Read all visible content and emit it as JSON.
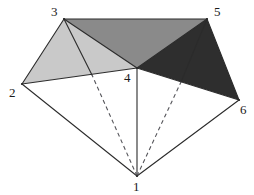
{
  "figure": {
    "canvas": {
      "width": 254,
      "height": 195,
      "background": "#ffffff"
    },
    "colors": {
      "stroke": "#2b2b2b",
      "dashed_stroke": "#55555a",
      "face_light_gray": "#c9c9c9",
      "face_medium_gray": "#8a8a8a",
      "face_dark": "#2e2e2e",
      "face_white": "#ffffff",
      "label": "#1a1a1a"
    },
    "vertices": [
      {
        "id": "1",
        "label": "1",
        "x": 137,
        "y": 176,
        "label_x": 133,
        "label_y": 180
      },
      {
        "id": "2",
        "label": "2",
        "x": 22,
        "y": 84,
        "label_x": 9,
        "label_y": 86
      },
      {
        "id": "3",
        "label": "3",
        "x": 64,
        "y": 19,
        "label_x": 51,
        "label_y": 5
      },
      {
        "id": "4",
        "label": "4",
        "x": 137,
        "y": 68,
        "label_x": 124,
        "label_y": 71
      },
      {
        "id": "5",
        "label": "5",
        "x": 207,
        "y": 19,
        "label_x": 214,
        "label_y": 5
      },
      {
        "id": "6",
        "label": "6",
        "x": 239,
        "y": 100,
        "label_x": 240,
        "label_y": 103
      }
    ],
    "interior_points": [
      {
        "id": "p_left",
        "x": 92,
        "y": 75,
        "on_edge": "2-4"
      },
      {
        "id": "p_right",
        "x": 181,
        "y": 82,
        "on_edge": "4-6"
      }
    ],
    "faces": [
      {
        "id": "face-3-2-4",
        "points": "64,19 22,84 137,68",
        "fill": "#c9c9c9",
        "name": "light-gray-face"
      },
      {
        "id": "face-3-4-5",
        "points": "64,19 137,68 207,19",
        "fill": "#8a8a8a",
        "name": "medium-gray-face"
      },
      {
        "id": "face-4-5-6",
        "points": "137,68 207,19 239,100",
        "fill": "#2e2e2e",
        "name": "dark-face"
      },
      {
        "id": "face-2-4-1",
        "points": "22,84 137,68 137,176",
        "fill": "#ffffff",
        "name": "white-face-left"
      },
      {
        "id": "face-4-6-1",
        "points": "137,68 239,100 137,176",
        "fill": "#ffffff",
        "name": "white-face-right"
      }
    ],
    "solid_edges": [
      {
        "id": "edge-2-3",
        "x1": 22,
        "y1": 84,
        "x2": 64,
        "y2": 19
      },
      {
        "id": "edge-3-5",
        "x1": 64,
        "y1": 19,
        "x2": 207,
        "y2": 19
      },
      {
        "id": "edge-5-6",
        "x1": 207,
        "y1": 19,
        "x2": 239,
        "y2": 100
      },
      {
        "id": "edge-2-4",
        "x1": 22,
        "y1": 84,
        "x2": 137,
        "y2": 68
      },
      {
        "id": "edge-4-6",
        "x1": 137,
        "y1": 68,
        "x2": 239,
        "y2": 100
      },
      {
        "id": "edge-3-4",
        "x1": 64,
        "y1": 19,
        "x2": 137,
        "y2": 68
      },
      {
        "id": "edge-4-5",
        "x1": 137,
        "y1": 68,
        "x2": 207,
        "y2": 19
      },
      {
        "id": "edge-3-pleft",
        "x1": 64,
        "y1": 19,
        "x2": 92,
        "y2": 75
      },
      {
        "id": "edge-5-pright",
        "x1": 207,
        "y1": 19,
        "x2": 181,
        "y2": 82
      },
      {
        "id": "edge-2-1",
        "x1": 22,
        "y1": 84,
        "x2": 137,
        "y2": 176
      },
      {
        "id": "edge-6-1",
        "x1": 239,
        "y1": 100,
        "x2": 137,
        "y2": 176
      },
      {
        "id": "edge-4-1",
        "x1": 137,
        "y1": 68,
        "x2": 137,
        "y2": 176
      }
    ],
    "dashed_edges": [
      {
        "id": "dash-1-pleft",
        "x1": 137,
        "y1": 176,
        "x2": 92,
        "y2": 75
      },
      {
        "id": "dash-1-pright",
        "x1": 137,
        "y1": 176,
        "x2": 181,
        "y2": 82
      }
    ]
  }
}
